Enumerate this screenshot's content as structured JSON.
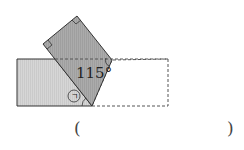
{
  "diagram": {
    "angle_label": "115°",
    "marked_angle_label": "㉠",
    "answer_open": "(",
    "answer_close": ")",
    "colors": {
      "light_fill": "#d8d8d8",
      "dark_fill": "#a9a9a9",
      "stroke": "#333333",
      "dashed": "#555555"
    }
  }
}
